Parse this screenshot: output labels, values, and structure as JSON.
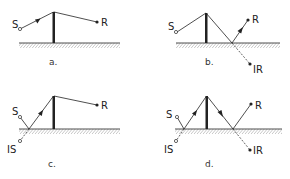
{
  "figure": {
    "panels": [
      {
        "id": "a",
        "caption": "a.",
        "labels": {
          "source": "S",
          "receiver": "R"
        }
      },
      {
        "id": "b",
        "caption": "b.",
        "labels": {
          "source": "S",
          "receiver": "R",
          "image_receiver": "IR"
        }
      },
      {
        "id": "c",
        "caption": "c.",
        "labels": {
          "source": "S",
          "receiver": "R",
          "image_source": "IS"
        }
      },
      {
        "id": "d",
        "caption": "d.",
        "labels": {
          "source": "S",
          "receiver": "R",
          "image_source": "IS",
          "image_receiver": "IR"
        }
      }
    ],
    "colors": {
      "ink": "#222222",
      "hatch": "#777777",
      "background": "#ffffff"
    }
  }
}
